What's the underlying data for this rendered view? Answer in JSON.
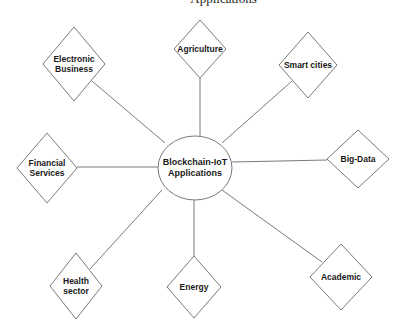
{
  "header_fragment": "Applications",
  "diagram": {
    "center": {
      "label": "Blockchain-IoT\nApplications",
      "shape": "ellipse",
      "cx": 195,
      "cy": 168,
      "rx": 37,
      "ry": 32
    },
    "nodes": [
      {
        "id": "electronic-business",
        "label": "Electronic\nBusiness",
        "cx": 74,
        "cy": 64,
        "hw": 31,
        "hh": 37,
        "line": [
          92,
          81,
          165,
          143
        ]
      },
      {
        "id": "agriculture",
        "label": "Agriculture",
        "cx": 200,
        "cy": 49,
        "hw": 26,
        "hh": 29,
        "line": [
          200,
          78,
          200,
          136
        ]
      },
      {
        "id": "smart-cities",
        "label": "Smart cities",
        "cx": 308,
        "cy": 65,
        "hw": 29,
        "hh": 33,
        "line": [
          292,
          81,
          222,
          143
        ]
      },
      {
        "id": "big-data",
        "label": "Big-Data",
        "cx": 358,
        "cy": 159,
        "hw": 31,
        "hh": 29,
        "line": [
          327,
          160,
          232,
          162
        ]
      },
      {
        "id": "financial-services",
        "label": "Financial\nServices",
        "cx": 47,
        "cy": 168,
        "hw": 30,
        "hh": 35,
        "line": [
          77,
          167,
          158,
          167
        ]
      },
      {
        "id": "health-sector",
        "label": "Health\nsector",
        "cx": 76,
        "cy": 286,
        "hw": 26,
        "hh": 33,
        "line": [
          90,
          269,
          162,
          190
        ]
      },
      {
        "id": "energy",
        "label": "Energy",
        "cx": 194,
        "cy": 287,
        "hw": 27,
        "hh": 31,
        "line": [
          194,
          256,
          194,
          200
        ]
      },
      {
        "id": "academic",
        "label": "Academic",
        "cx": 341,
        "cy": 277,
        "hw": 31,
        "hh": 33,
        "line": [
          322,
          262,
          222,
          190
        ]
      }
    ],
    "colors": {
      "stroke": "#7a7a7a",
      "fill": "#ffffff",
      "text": "#1a1a1a"
    }
  }
}
